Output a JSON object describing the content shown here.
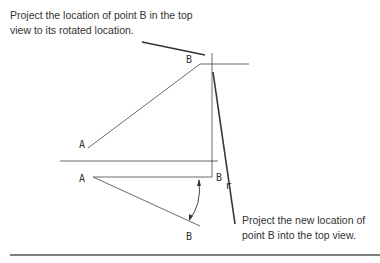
{
  "annotations": {
    "top_note_line1": "Project the location of point B in the top",
    "top_note_line2": "view to its rotated location.",
    "bottom_note_line1": "Project the new location of",
    "bottom_note_line2": "point B into the top view."
  },
  "labels": {
    "front_B": "B",
    "front_A": "A",
    "top_A": "A",
    "top_B": "B",
    "top_Br_main": "B",
    "top_Br_sub": "r"
  },
  "colors": {
    "line": "#333333",
    "text": "#333333"
  }
}
